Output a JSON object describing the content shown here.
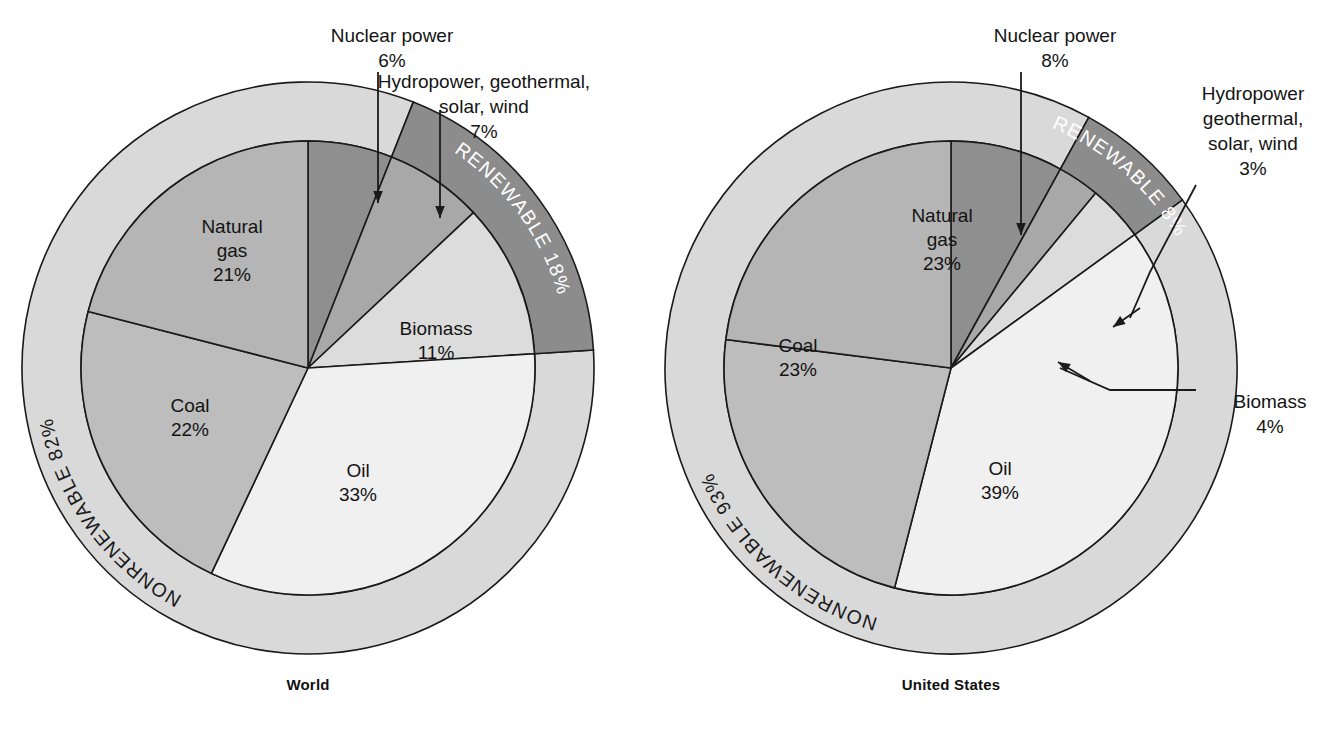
{
  "figure": {
    "background": "#ffffff",
    "colors": {
      "nonrenewable_ring": "#d9d9d9",
      "renewable_ring": "#8c8c8c",
      "nuclear": "#8f8f8f",
      "hydro_geo_solar_wind": "#a8a8a8",
      "biomass": "#dcdcdc",
      "oil": "#f0f0f0",
      "coal": "#bdbdbd",
      "natural_gas": "#b5b5b5",
      "stroke": "#1a1a1a",
      "ring_text_light": "#ffffff",
      "ring_text_dark": "#1a1a1a"
    }
  },
  "charts": [
    {
      "id": "world",
      "caption": "World",
      "center": {
        "x": 308,
        "y": 368
      },
      "inner_radius": 227,
      "outer_radius": 286,
      "rings": [
        {
          "name": "nonrenewable",
          "label": "NONRENEWABLE 82%",
          "value": 82,
          "text_color": "dark",
          "fill": "#d9d9d9"
        },
        {
          "name": "renewable",
          "label": "RENEWABLE 18%",
          "value": 18,
          "text_color": "light",
          "fill": "#8c8c8c"
        }
      ],
      "slices": [
        {
          "name": "nuclear",
          "label": "Nuclear power",
          "value": 6,
          "value_label": "6%",
          "fill": "#8f8f8f",
          "callout": true
        },
        {
          "name": "hydro",
          "label": "Hydropower, geothermal, solar, wind",
          "value": 7,
          "value_label": "7%",
          "fill": "#a8a8a8",
          "callout": true
        },
        {
          "name": "biomass",
          "label": "Biomass",
          "value": 11,
          "value_label": "11%",
          "fill": "#dcdcdc",
          "callout": false
        },
        {
          "name": "oil",
          "label": "Oil",
          "value": 33,
          "value_label": "33%",
          "fill": "#f0f0f0",
          "callout": false
        },
        {
          "name": "coal",
          "label": "Coal",
          "value": 22,
          "value_label": "22%",
          "fill": "#bdbdbd",
          "callout": false
        },
        {
          "name": "natural_gas",
          "label": "Natural gas",
          "value": 21,
          "value_label": "21%",
          "fill": "#b5b5b5",
          "callout": false
        }
      ],
      "callouts": [
        {
          "name": "nuclear-callout",
          "lines": [
            "Nuclear power",
            "6%"
          ],
          "x": 392,
          "y": 42,
          "align": "middle"
        },
        {
          "name": "hydro-callout",
          "lines": [
            "Hydropower, geothermal,",
            "solar, wind",
            "7%"
          ],
          "x": 484,
          "y": 88,
          "align": "middle"
        }
      ],
      "inner_labels": [
        {
          "name": "natural-gas-label",
          "lines": [
            "Natural",
            "gas",
            "21%"
          ],
          "x": 232,
          "y": 233
        },
        {
          "name": "coal-label",
          "lines": [
            "Coal",
            "22%"
          ],
          "x": 190,
          "y": 412
        },
        {
          "name": "oil-label",
          "lines": [
            "Oil",
            "33%"
          ],
          "x": 358,
          "y": 477
        },
        {
          "name": "biomass-label",
          "lines": [
            "Biomass",
            "11%"
          ],
          "x": 436,
          "y": 335
        }
      ]
    },
    {
      "id": "united-states",
      "caption": "United States",
      "center": {
        "x": 951,
        "y": 368
      },
      "inner_radius": 227,
      "outer_radius": 286,
      "rings": [
        {
          "name": "nonrenewable",
          "label": "NONRENEWABLE 93%",
          "value": 93,
          "text_color": "dark",
          "fill": "#d9d9d9"
        },
        {
          "name": "renewable",
          "label": "RENEWABLE 8%",
          "value": 8,
          "text_color": "light",
          "fill": "#8c8c8c"
        }
      ],
      "slices": [
        {
          "name": "nuclear",
          "label": "Nuclear power",
          "value": 8,
          "value_label": "8%",
          "fill": "#8f8f8f",
          "callout": true
        },
        {
          "name": "hydro",
          "label": "Hydropower geothermal, solar, wind",
          "value": 3,
          "value_label": "3%",
          "fill": "#a8a8a8",
          "callout": true
        },
        {
          "name": "biomass",
          "label": "Biomass",
          "value": 4,
          "value_label": "4%",
          "fill": "#dcdcdc",
          "callout": true
        },
        {
          "name": "oil",
          "label": "Oil",
          "value": 39,
          "value_label": "39%",
          "fill": "#f0f0f0",
          "callout": false
        },
        {
          "name": "coal",
          "label": "Coal",
          "value": 23,
          "value_label": "23%",
          "fill": "#bdbdbd",
          "callout": false
        },
        {
          "name": "natural_gas",
          "label": "Natural gas",
          "value": 23,
          "value_label": "23%",
          "fill": "#b5b5b5",
          "callout": false
        }
      ],
      "callouts": [
        {
          "name": "nuclear-callout",
          "lines": [
            "Nuclear power",
            "8%"
          ],
          "x": 1055,
          "y": 42,
          "align": "middle"
        },
        {
          "name": "hydro-callout",
          "lines": [
            "Hydropower",
            "geothermal,",
            "solar, wind",
            "3%"
          ],
          "x": 1253,
          "y": 100,
          "align": "middle"
        },
        {
          "name": "biomass-callout",
          "lines": [
            "Biomass",
            "4%"
          ],
          "x": 1270,
          "y": 408,
          "align": "middle"
        }
      ],
      "inner_labels": [
        {
          "name": "natural-gas-label",
          "lines": [
            "Natural",
            "gas",
            "23%"
          ],
          "x": 942,
          "y": 222
        },
        {
          "name": "coal-label",
          "lines": [
            "Coal",
            "23%"
          ],
          "x": 798,
          "y": 352
        },
        {
          "name": "oil-label",
          "lines": [
            "Oil",
            "39%"
          ],
          "x": 1000,
          "y": 475
        }
      ]
    }
  ],
  "chart_data": {
    "type": "pie",
    "charts": [
      {
        "name": "World",
        "categories": [
          "Nuclear power",
          "Hydropower, geothermal, solar, wind",
          "Biomass",
          "Oil",
          "Coal",
          "Natural gas"
        ],
        "values": [
          6,
          7,
          11,
          33,
          22,
          21
        ],
        "units": "%",
        "groups": [
          {
            "name": "RENEWABLE",
            "value": 18,
            "members": [
              "Hydropower, geothermal, solar, wind",
              "Biomass"
            ]
          },
          {
            "name": "NONRENEWABLE",
            "value": 82,
            "members": [
              "Nuclear power",
              "Oil",
              "Coal",
              "Natural gas"
            ]
          }
        ]
      },
      {
        "name": "United States",
        "categories": [
          "Nuclear power",
          "Hydropower geothermal, solar, wind",
          "Biomass",
          "Oil",
          "Coal",
          "Natural gas"
        ],
        "values": [
          8,
          3,
          4,
          39,
          23,
          23
        ],
        "units": "%",
        "groups": [
          {
            "name": "RENEWABLE",
            "value": 8,
            "members": [
              "Hydropower geothermal, solar, wind",
              "Biomass"
            ]
          },
          {
            "name": "NONRENEWABLE",
            "value": 93,
            "members": [
              "Nuclear power",
              "Oil",
              "Coal",
              "Natural gas"
            ]
          }
        ]
      }
    ],
    "legend": "none",
    "grid": false
  }
}
